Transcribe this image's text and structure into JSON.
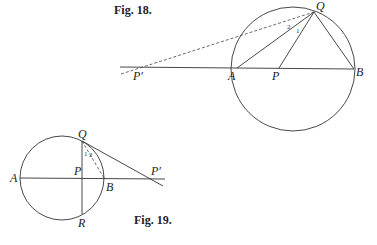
{
  "figures": [
    {
      "caption": "Fig. 18.",
      "points": {
        "Q": "Q",
        "A": "A",
        "P": "P",
        "B": "B",
        "P_prime": "P′"
      },
      "angles": {
        "one": "1",
        "two": "2"
      }
    },
    {
      "caption": "Fig. 19.",
      "points": {
        "Q": "Q",
        "A": "A",
        "P": "P",
        "B": "B",
        "R": "R",
        "P_prime": "P′"
      },
      "angles": {
        "one": "1",
        "two": "2"
      }
    }
  ]
}
